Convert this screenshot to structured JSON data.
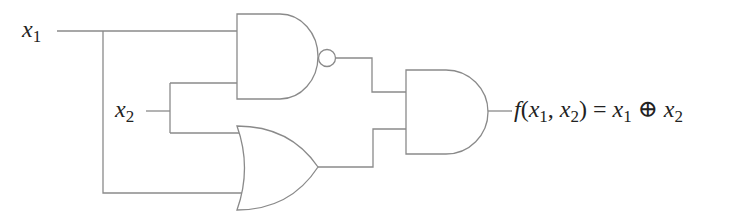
{
  "diagram": {
    "type": "logic-circuit",
    "inputs": [
      {
        "name": "x",
        "sub": "1"
      },
      {
        "name": "x",
        "sub": "2"
      }
    ],
    "gates": [
      {
        "id": "nand",
        "kind": "NAND",
        "inputs": [
          "x1",
          "x2"
        ]
      },
      {
        "id": "or",
        "kind": "OR",
        "inputs": [
          "x2",
          "x1"
        ]
      },
      {
        "id": "and",
        "kind": "AND",
        "inputs": [
          "nand",
          "or"
        ]
      }
    ],
    "output": {
      "f": "f",
      "open": "(",
      "a": "x",
      "a_sub": "1",
      "comma": ", ",
      "b": "x",
      "b_sub": "2",
      "close": ")",
      "eq": " = ",
      "c": "x",
      "c_sub": "1",
      "op": " ⊕ ",
      "d": "x",
      "d_sub": "2"
    },
    "colors": {
      "line": "#8a8a8a",
      "text": "#222222",
      "background": "#ffffff"
    }
  }
}
